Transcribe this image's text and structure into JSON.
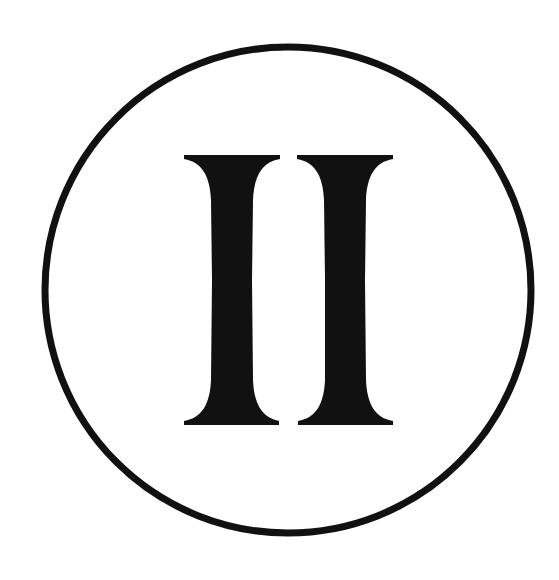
{
  "emblem": {
    "numeral": "II",
    "numeral_meaning": "Roman numeral two",
    "glyph_count": 2,
    "colors": {
      "background": "#ffffff",
      "ink": "#111111"
    },
    "circle": {
      "cx": 288,
      "cy": 290,
      "r": 243,
      "stroke_width": 7
    }
  }
}
